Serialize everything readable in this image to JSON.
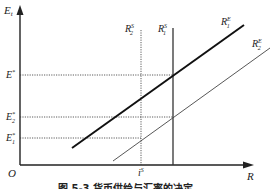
{
  "diagram": {
    "type": "economics-line-diagram",
    "axes": {
      "y_label": "E",
      "y_label_sub": "t",
      "x_label": "R",
      "origin_label": "O"
    },
    "y_levels": [
      {
        "name": "E*",
        "base": "E",
        "sup": "*",
        "sub": ""
      },
      {
        "name": "E2*",
        "base": "E",
        "sup": "*",
        "sub": "2"
      },
      {
        "name": "E1*",
        "base": "E",
        "sup": "*",
        "sub": "1"
      }
    ],
    "vertical_lines": [
      {
        "name": "R2S",
        "base": "R",
        "sup": "S",
        "sub": "2",
        "style": "dotted"
      },
      {
        "name": "R1S",
        "base": "R",
        "sup": "S",
        "sub": "1",
        "style": "solid"
      }
    ],
    "sloped_lines": [
      {
        "name": "R1E",
        "base": "R",
        "sup": "E",
        "sub": "1",
        "style": "thick"
      },
      {
        "name": "R2E",
        "base": "R",
        "sup": "E",
        "sub": "2",
        "style": "thin"
      }
    ],
    "x_marker": {
      "base": "i",
      "sup": "S"
    },
    "caption": "图 5-3   货币供给与汇率的决定"
  }
}
